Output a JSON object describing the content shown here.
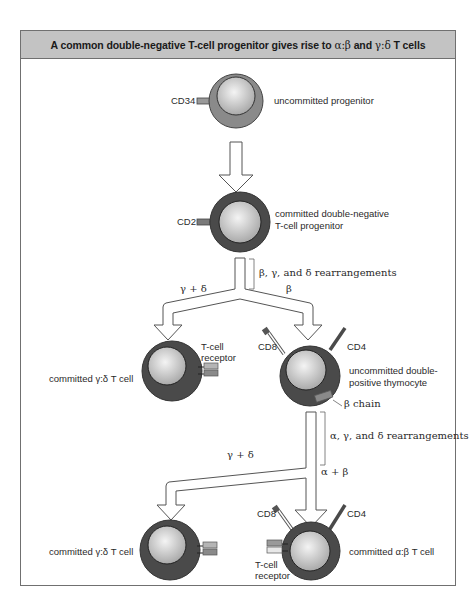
{
  "title": {
    "prefix": "A common double-negative T-cell progenitor gives rise to ",
    "alpha_beta": "α:β",
    "middle": " and ",
    "gamma_delta": "γ:δ",
    "suffix": " T cells"
  },
  "colors": {
    "title_bar": "#c3c3c3",
    "frame_border": "#707070",
    "uncommitted_ring": "#8a8a8a",
    "committed_ring": "#4a4a4a",
    "nucleus": "#d8d8d8",
    "receptor": "#9a9a9a"
  },
  "cells": {
    "uncommitted_progenitor": {
      "marker": "CD34",
      "label": "uncommitted progenitor"
    },
    "double_negative": {
      "marker": "CD2",
      "label_line1": "committed double-negative",
      "label_line2": "T-cell progenitor"
    },
    "gd_cell_1": {
      "label": "committed γ:δ T cell",
      "receptor_label_line1": "T-cell",
      "receptor_label_line2": "receptor"
    },
    "double_positive": {
      "marker_left": "CD8",
      "marker_right": "CD4",
      "label_line1": "uncommitted double-",
      "label_line2": "positive thymocyte",
      "chain_label": "β chain"
    },
    "gd_cell_2": {
      "label": "committed γ:δ T cell"
    },
    "ab_cell": {
      "marker_left": "CD8",
      "marker_right": "CD4",
      "label": "committed α:β T cell",
      "receptor_label_line1": "T-cell",
      "receptor_label_line2": "receptor"
    }
  },
  "arrows": {
    "rearrangement_1": "β, γ, and δ rearrangements",
    "branch_1_left": "γ + δ",
    "branch_1_right": "β",
    "rearrangement_2": "α, γ, and δ rearrangements",
    "branch_2_left": "γ + δ",
    "branch_2_right": "α + β"
  }
}
